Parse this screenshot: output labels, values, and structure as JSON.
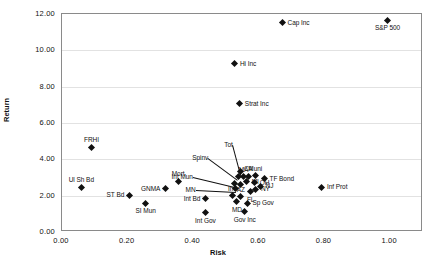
{
  "chart_data": {
    "type": "scatter",
    "title": "",
    "xlabel": "Risk",
    "ylabel": "Return",
    "xlim": [
      0.0,
      1.1
    ],
    "ylim": [
      0.0,
      12.0
    ],
    "xticks": [
      "0.00",
      "0.20",
      "0.40",
      "0.60",
      "0.80",
      "1.00"
    ],
    "xtick_values": [
      0.0,
      0.2,
      0.4,
      0.6,
      0.8,
      1.0
    ],
    "yticks": [
      "0.00",
      "2.00",
      "4.00",
      "6.00",
      "8.00",
      "10.00",
      "12.00"
    ],
    "ytick_values": [
      0,
      2,
      4,
      6,
      8,
      10,
      12
    ],
    "grid": "horizontal",
    "legend": "none",
    "marker": "diamond",
    "marker_color": "#111111",
    "points": [
      {
        "label": "S&P 500",
        "x": 0.995,
        "y": 11.6,
        "lp": "below"
      },
      {
        "label": "Cap Inc",
        "x": 0.675,
        "y": 11.45,
        "lp": "right"
      },
      {
        "label": "Hi Inc",
        "x": 0.53,
        "y": 9.2,
        "lp": "right"
      },
      {
        "label": "Strat Inc",
        "x": 0.545,
        "y": 7.0,
        "lp": "right"
      },
      {
        "label": "FRHI",
        "x": 0.093,
        "y": 4.62,
        "lp": "above"
      },
      {
        "label": "Tot",
        "x": 0.548,
        "y": 3.3,
        "lp": "leader"
      },
      {
        "label": "Spinv",
        "x": 0.54,
        "y": 3.02,
        "lp": "leader"
      },
      {
        "label": "MA",
        "x": 0.556,
        "y": 3.0,
        "lp": "above"
      },
      {
        "label": "CA",
        "x": 0.571,
        "y": 3.02,
        "lp": "above"
      },
      {
        "label": "Muni",
        "x": 0.592,
        "y": 3.05,
        "lp": "above"
      },
      {
        "label": "TF Bond",
        "x": 0.62,
        "y": 2.88,
        "lp": "right"
      },
      {
        "label": "Mort",
        "x": 0.357,
        "y": 2.75,
        "lp": "above"
      },
      {
        "label": "Int Mun",
        "x": 0.53,
        "y": 2.62,
        "lp": "leader"
      },
      {
        "label": "MI",
        "x": 0.566,
        "y": 2.72,
        "lp": "right"
      },
      {
        "label": "OH",
        "x": 0.59,
        "y": 2.65,
        "lp": "right"
      },
      {
        "label": "NJ",
        "x": 0.608,
        "y": 2.45,
        "lp": "right"
      },
      {
        "label": "Ul Sh Bd",
        "x": 0.062,
        "y": 2.4,
        "lp": "above"
      },
      {
        "label": "GNMA",
        "x": 0.318,
        "y": 2.32,
        "lp": "left"
      },
      {
        "label": "MN",
        "x": 0.532,
        "y": 2.35,
        "lp": "leader"
      },
      {
        "label": "CL",
        "x": 0.548,
        "y": 2.58,
        "lp": "none"
      },
      {
        "label": "NY",
        "x": 0.594,
        "y": 2.3,
        "lp": "right"
      },
      {
        "label": "FL",
        "x": 0.578,
        "y": 2.15,
        "lp": "below"
      },
      {
        "label": "Inf Prot",
        "x": 0.795,
        "y": 2.4,
        "lp": "right"
      },
      {
        "label": "ST Bd",
        "x": 0.208,
        "y": 1.97,
        "lp": "left"
      },
      {
        "label": "Int Bd",
        "x": 0.44,
        "y": 1.78,
        "lp": "left"
      },
      {
        "label": "Inv",
        "x": 0.522,
        "y": 1.95,
        "lp": "above"
      },
      {
        "label": "AZ",
        "x": 0.548,
        "y": 1.88,
        "lp": "above"
      },
      {
        "label": "MD",
        "x": 0.536,
        "y": 1.62,
        "lp": "below"
      },
      {
        "label": "SI Mun",
        "x": 0.258,
        "y": 1.52,
        "lp": "below"
      },
      {
        "label": "Sp Gov",
        "x": 0.568,
        "y": 1.52,
        "lp": "right"
      },
      {
        "label": "Int Gov",
        "x": 0.44,
        "y": 1.0,
        "lp": "below"
      },
      {
        "label": "Gov Inc",
        "x": 0.56,
        "y": 1.05,
        "lp": "below"
      }
    ]
  }
}
